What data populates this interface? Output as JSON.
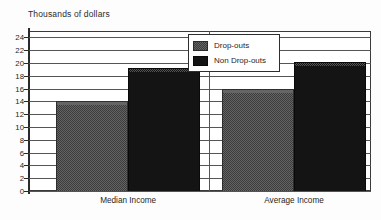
{
  "chart_data": {
    "type": "bar",
    "title": "Thousands of dollars",
    "xlabel": "",
    "ylabel": "Thousands of dollars",
    "categories": [
      "Median Income",
      "Average Income"
    ],
    "series": [
      {
        "name": "Drop-outs",
        "values": [
          14.0,
          16.0
        ],
        "color": "#646464"
      },
      {
        "name": "Non Drop-outs",
        "values": [
          19.2,
          20.2
        ],
        "color": "#141414"
      }
    ],
    "ylim": [
      0,
      25
    ],
    "yticks": [
      0,
      2,
      4,
      6,
      8,
      10,
      12,
      14,
      16,
      18,
      20,
      22,
      24
    ],
    "ytick_labels": [
      "0",
      "2",
      "4",
      "6",
      "8",
      "10",
      "12",
      "14",
      "16",
      "18",
      "20",
      "22",
      "24"
    ],
    "grid": true,
    "grid_axis": "y",
    "legend": {
      "position": "upper-center",
      "entries": [
        "Drop-outs",
        "Non Drop-outs"
      ]
    }
  },
  "legend": {
    "entries": [
      {
        "label": "Drop-outs"
      },
      {
        "label": "Non Drop-outs"
      }
    ]
  },
  "axes": {
    "y_title": "Thousands of dollars"
  }
}
